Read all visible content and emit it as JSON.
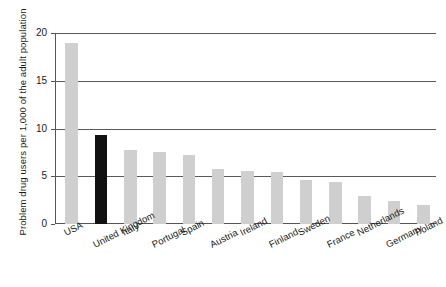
{
  "chart_data": {
    "type": "bar",
    "title": "",
    "subtitle": "",
    "xlabel": "",
    "ylabel": "Problem drug users per 1,000 of the adult population",
    "ylim": [
      0,
      20
    ],
    "yticks": [
      0,
      5,
      10,
      15,
      20
    ],
    "ytick_labels": [
      "0",
      "5",
      "10",
      "15",
      "20"
    ],
    "grid": true,
    "legend": "none",
    "highlight_category": "United Kingdom",
    "colors": {
      "bar": "#cfcfcf",
      "highlight_bar": "#111111",
      "grid": "#5a5a5a",
      "axis": "#555555",
      "text": "#1a1a1a",
      "background": "#ffffff"
    },
    "categories": [
      "USA",
      "United Kingdom",
      "Italy",
      "Portugal",
      "Spain",
      "Austria",
      "Ireland",
      "Finland",
      "Sweden",
      "France",
      "Netherlands",
      "Germany",
      "Poland"
    ],
    "values": [
      19.0,
      9.3,
      7.8,
      7.5,
      7.2,
      5.8,
      5.6,
      5.4,
      4.6,
      4.4,
      2.9,
      2.4,
      2.0
    ]
  }
}
